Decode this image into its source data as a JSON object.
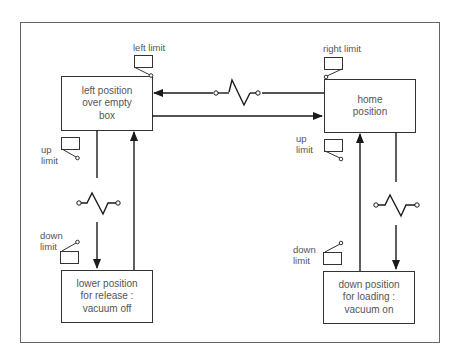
{
  "diagram": {
    "type": "state-transition",
    "states": {
      "left_over_box": {
        "lines": [
          "left position",
          "over empty",
          "box"
        ]
      },
      "home": {
        "lines": [
          "home",
          "position"
        ]
      },
      "lower_release": {
        "lines": [
          "lower position",
          "for release :",
          "vacuum off"
        ]
      },
      "down_loading": {
        "lines": [
          "down position",
          "for loading :",
          "vacuum on"
        ]
      }
    },
    "limit_switches": {
      "left_limit": "left limit",
      "right_limit": "right limit",
      "left_up": [
        "up",
        "limit"
      ],
      "left_down": [
        "down",
        "limit"
      ],
      "right_up": [
        "up",
        "limit"
      ],
      "right_down": [
        "down",
        "limit"
      ]
    },
    "colors": {
      "line": "#1a1a1a",
      "frame": "#555555",
      "text": "#555555",
      "background": "#ffffff"
    }
  }
}
